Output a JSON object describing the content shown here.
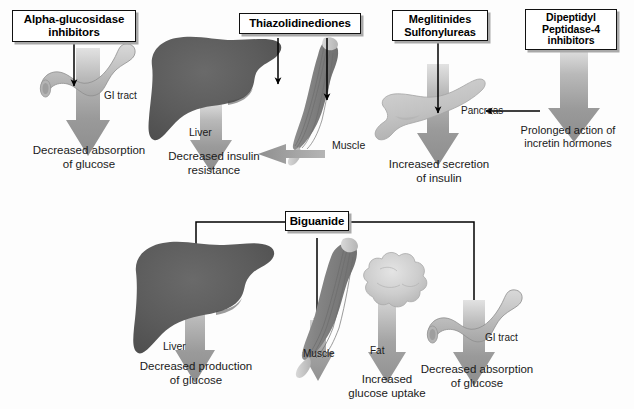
{
  "figure": {
    "background": "#fdfdfd",
    "colors": {
      "box_fill": "#ffffff",
      "box_border": "#111111",
      "box_shadow": "#a9a9a9",
      "liver_dark": "#595959",
      "muscle_mid": "#8a8a8a",
      "pancreas_light": "#c8c8c8",
      "fat_light": "#cfcfcf",
      "gi_light": "#bdbdbd",
      "arrow_gray": "#8f8f8f",
      "line_black": "#000000",
      "text": "#1a1a1a"
    }
  },
  "top_row": {
    "drugs": [
      {
        "id": "alpha-glucosidase-inhibitors",
        "label": "Alpha-glucosidase\ninhibitors",
        "target_organ": "GI tract",
        "effect": "Decreased absorption\nof glucose"
      },
      {
        "id": "thiazolidinediones",
        "label": "Thiazolidinediones",
        "target_organ": "Liver",
        "target_organ_2": "Muscle",
        "effect": "Decreased insulin\nresistance"
      },
      {
        "id": "meglitinides-sulfonylureas",
        "label": "Meglitinides\nSulfonylureas",
        "target_organ": "Pancreas",
        "effect": "Increased secretion\nof insulin"
      },
      {
        "id": "dipeptidyl-peptidase-4-inhibitors",
        "label": "Dipeptidyl\nPeptidase-4\ninhibitors",
        "target_organ": "Pancreas",
        "effect": "Prolonged action of\nincretin hormones"
      }
    ]
  },
  "bottom_row": {
    "drug": {
      "id": "biguanide",
      "label": "Biguanide"
    },
    "targets": [
      {
        "id": "liver",
        "organ": "Liver",
        "effect": "Decreased production\nof glucose"
      },
      {
        "id": "muscle",
        "organ": "Muscle",
        "effect": "Increased\nglucose uptake"
      },
      {
        "id": "fat",
        "organ": "Fat",
        "effect": "Increased\nglucose uptake"
      },
      {
        "id": "gi-tract",
        "organ": "GI tract",
        "effect": "Decreased absorption\nof glucose"
      }
    ]
  },
  "organ_labels": {
    "gi_top": "GI tract",
    "liver_top": "Liver",
    "muscle_top": "Muscle",
    "pancreas_top": "Pancreas",
    "liver_bottom": "Liver",
    "muscle_bottom": "Muscle",
    "fat_bottom": "Fat",
    "gi_bottom": "GI tract"
  },
  "captions": {
    "dec_absorption_top": "Decreased absorption\nof glucose",
    "dec_insulin_resistance": "Decreased insulin\nresistance",
    "inc_secretion_insulin": "Increased secretion\nof insulin",
    "prolonged_incretin": "Prolonged action of\nincretin hormones",
    "dec_production_glucose": "Decreased production\nof glucose",
    "inc_glucose_uptake": "Increased\nglucose uptake",
    "dec_absorption_bottom": "Decreased absorption\nof glucose"
  }
}
